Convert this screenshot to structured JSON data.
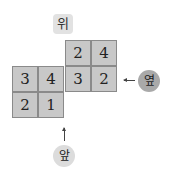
{
  "labels": {
    "top": "위",
    "side": "옆",
    "front": "앞"
  },
  "grid": {
    "rows": [
      {
        "cells": [
          {
            "col": 2,
            "value": "2"
          },
          {
            "col": 3,
            "value": "4"
          }
        ]
      },
      {
        "cells": [
          {
            "col": 0,
            "value": "3"
          },
          {
            "col": 1,
            "value": "4"
          },
          {
            "col": 2,
            "value": "3"
          },
          {
            "col": 3,
            "value": "2"
          }
        ]
      },
      {
        "cells": [
          {
            "col": 0,
            "value": "2"
          },
          {
            "col": 1,
            "value": "1"
          }
        ]
      }
    ]
  },
  "colors": {
    "cell_fill": "#c8c8c8",
    "cell_border": "#8a8a8a",
    "side_circle": "#a9a9a9",
    "front_circle": "#dcdcdc"
  }
}
